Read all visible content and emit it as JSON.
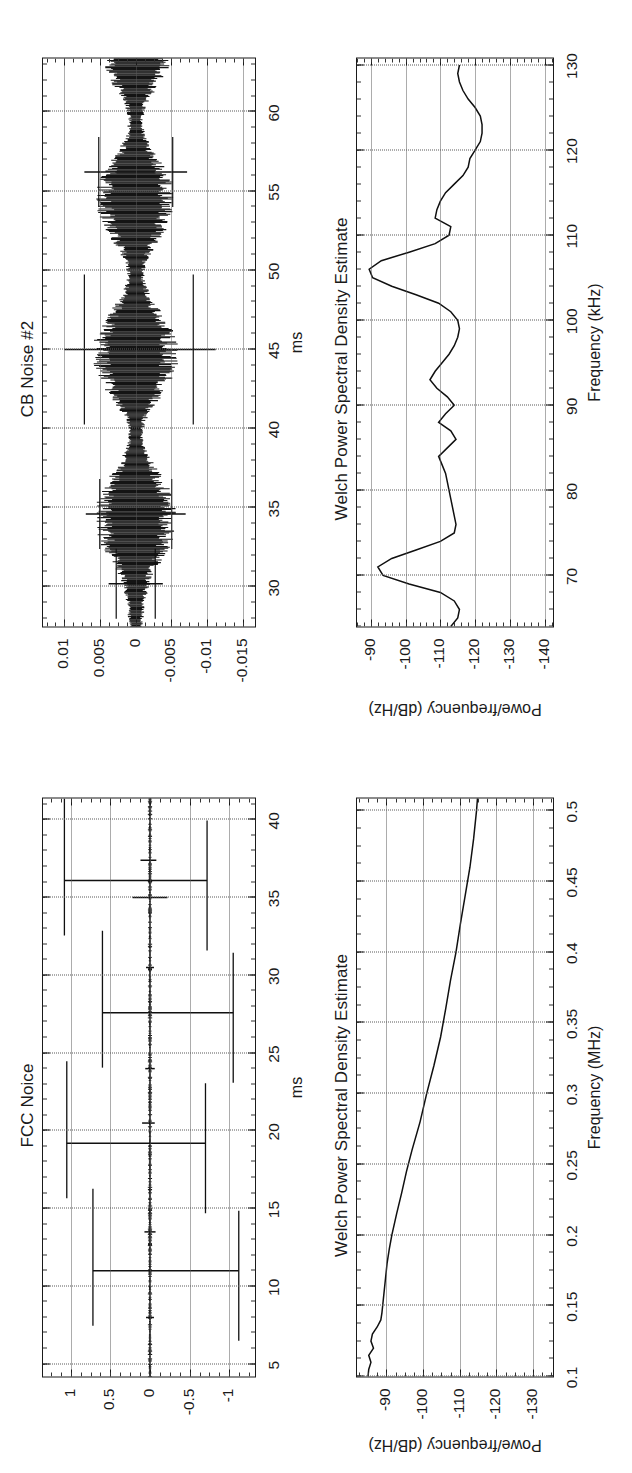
{
  "figure": {
    "layout": "2x2 grid, rotated 90 degrees counter-clockwise on the page",
    "panel_count": 4
  },
  "panels": {
    "cb_time": {
      "title": "CB Noise #2",
      "xlabel": "ms",
      "ylabel": "",
      "xticks": [
        "30",
        "35",
        "40",
        "45",
        "50",
        "55",
        "60"
      ],
      "yticks": [
        "0.01",
        "0.005",
        "0",
        "-0.005",
        "-0.01",
        "-0.015"
      ]
    },
    "cb_psd": {
      "title": "Welch Power Spectral Density Estimate",
      "xlabel": "Frequency (kHz)",
      "ylabel": "Powe/frequency (dB/Hz)",
      "xticks": [
        "70",
        "80",
        "90",
        "100",
        "110",
        "120",
        "130"
      ],
      "yticks": [
        "-90",
        "-100",
        "-110",
        "-120",
        "-130",
        "-140"
      ]
    },
    "fcc_time": {
      "title": "FCC Noice",
      "xlabel": "ms",
      "ylabel": "",
      "xticks": [
        "5",
        "10",
        "15",
        "20",
        "25",
        "30",
        "35",
        "40"
      ],
      "yticks": [
        "1",
        "0.5",
        "0",
        "-0.5",
        "-1"
      ]
    },
    "fcc_psd": {
      "title": "Welch Power Spectral Density Estimate",
      "xlabel": "Frequency (MHz)",
      "ylabel": "Powe/frequency (dB/Hz)",
      "xticks": [
        "0.1",
        "0.15",
        "0.2",
        "0.25",
        "0.3",
        "0.35",
        "0.4",
        "0.45",
        "0.5"
      ],
      "yticks": [
        "-90",
        "-100",
        "-110",
        "-120",
        "-130"
      ]
    }
  },
  "chart_data": [
    {
      "id": "cb_time",
      "type": "line",
      "title": "CB Noise #2",
      "xlabel": "ms",
      "ylabel": "",
      "xlim": [
        27.5,
        63.5
      ],
      "ylim": [
        -0.017,
        0.013
      ],
      "xticks": [
        30,
        35,
        40,
        45,
        50,
        55,
        60
      ],
      "yticks": [
        0.01,
        0.005,
        0,
        -0.005,
        -0.01,
        -0.015
      ],
      "grid": true,
      "legend": "none",
      "description": "Amplitude-modulated impulsive noise burst train; envelope peaks near 34, 44, 54 and 62 ms with narrow nulls near 31, 39, 49 and 58 ms. Two tall isolated spikes at ~45 ms reaching +0.010 / -0.011.",
      "envelope_x": [
        27.5,
        29.0,
        30.5,
        31.5,
        32.5,
        33.5,
        34.5,
        35.5,
        36.5,
        37.5,
        38.5,
        39.5,
        40.5,
        41.5,
        42.5,
        43.5,
        44.5,
        45.5,
        46.5,
        47.5,
        48.5,
        49.5,
        50.5,
        51.5,
        52.5,
        53.5,
        54.5,
        55.5,
        56.5,
        57.5,
        58.5,
        59.5,
        60.5,
        61.5,
        62.5,
        63.5
      ],
      "envelope_pos": [
        0.001,
        0.0013,
        0.0022,
        0.0036,
        0.0048,
        0.0056,
        0.0058,
        0.0055,
        0.0045,
        0.003,
        0.0017,
        0.001,
        0.0014,
        0.0028,
        0.0044,
        0.0056,
        0.0062,
        0.006,
        0.005,
        0.0035,
        0.002,
        0.0012,
        0.0015,
        0.0028,
        0.0043,
        0.0053,
        0.0057,
        0.0054,
        0.0042,
        0.0026,
        0.0014,
        0.001,
        0.0016,
        0.003,
        0.0044,
        0.0052
      ],
      "envelope_neg": [
        -0.001,
        -0.0013,
        -0.0022,
        -0.0036,
        -0.0048,
        -0.0056,
        -0.0058,
        -0.0055,
        -0.0045,
        -0.003,
        -0.0017,
        -0.001,
        -0.0014,
        -0.0028,
        -0.0044,
        -0.0056,
        -0.0062,
        -0.006,
        -0.005,
        -0.0035,
        -0.002,
        -0.0012,
        -0.0015,
        -0.0028,
        -0.0043,
        -0.0053,
        -0.0057,
        -0.0054,
        -0.0042,
        -0.0026,
        -0.0014,
        -0.001,
        -0.0016,
        -0.003,
        -0.0044,
        -0.0052
      ],
      "spikes": [
        {
          "x": 45.0,
          "ymin": -0.0112,
          "ymax": 0.01
        },
        {
          "x": 56.2,
          "ymin": -0.0072,
          "ymax": 0.0072
        },
        {
          "x": 34.6,
          "ymin": -0.007,
          "ymax": 0.007
        },
        {
          "x": 30.2,
          "ymin": -0.0038,
          "ymax": 0.0038
        }
      ]
    },
    {
      "id": "cb_psd",
      "type": "line",
      "title": "Welch Power Spectral Density Estimate",
      "xlabel": "Frequency (kHz)",
      "ylabel": "Powe/frequency (dB/Hz)",
      "xlim": [
        64,
        131
      ],
      "ylim": [
        -143,
        -86
      ],
      "xticks": [
        70,
        80,
        90,
        100,
        110,
        120,
        130
      ],
      "yticks": [
        -90,
        -100,
        -110,
        -120,
        -130,
        -140
      ],
      "grid": true,
      "legend": "none",
      "x": [
        64,
        65,
        66,
        67,
        68,
        69,
        70,
        71,
        72,
        73,
        74,
        75,
        76,
        77,
        78,
        79,
        80,
        81,
        82,
        83,
        84,
        85,
        86,
        87,
        88,
        89,
        90,
        91,
        92,
        93,
        94,
        95,
        96,
        97,
        98,
        99,
        100,
        101,
        102,
        103,
        104,
        105,
        106,
        107,
        108,
        109,
        110,
        111,
        112,
        113,
        114,
        115,
        116,
        117,
        118,
        119,
        120,
        121,
        122,
        123,
        124,
        125,
        126,
        127,
        128,
        129,
        130
      ],
      "y": [
        -113.0,
        -115.0,
        -115.5,
        -114.0,
        -110.0,
        -101.0,
        -93.5,
        -92.0,
        -96.0,
        -103.0,
        -110.0,
        -114.0,
        -114.5,
        -114.0,
        -113.5,
        -113.0,
        -112.5,
        -112.0,
        -111.5,
        -110.5,
        -109.5,
        -112.0,
        -114.5,
        -113.0,
        -109.5,
        -111.5,
        -114.0,
        -112.0,
        -109.0,
        -107.0,
        -108.5,
        -110.5,
        -112.5,
        -114.0,
        -115.0,
        -115.5,
        -115.0,
        -113.0,
        -109.5,
        -103.0,
        -96.0,
        -90.5,
        -89.5,
        -93.0,
        -101.0,
        -108.5,
        -112.5,
        -113.0,
        -108.5,
        -109.0,
        -110.0,
        -111.5,
        -114.0,
        -116.5,
        -118.0,
        -118.5,
        -120.0,
        -121.5,
        -122.0,
        -122.0,
        -121.5,
        -120.0,
        -118.0,
        -116.5,
        -115.5,
        -115.0,
        -115.5
      ]
    },
    {
      "id": "fcc_time",
      "type": "line",
      "title": "FCC Noice",
      "xlabel": "ms",
      "ylabel": "",
      "xlim": [
        4.2,
        41.5
      ],
      "ylim": [
        -1.35,
        1.35
      ],
      "xticks": [
        5,
        10,
        15,
        20,
        25,
        30,
        35,
        40
      ],
      "yticks": [
        1,
        0.5,
        0,
        -0.5,
        -1
      ],
      "grid": true,
      "legend": "none",
      "description": "Impulsive FCC noise: low-level baseline near zero with four dominant full-scale impulses.",
      "baseline": 0,
      "spikes": [
        {
          "x": 11.0,
          "ymin": -1.12,
          "ymax": 0.72
        },
        {
          "x": 19.2,
          "ymin": -0.7,
          "ymax": 1.05
        },
        {
          "x": 27.6,
          "ymin": -1.05,
          "ymax": 0.6
        },
        {
          "x": 36.1,
          "ymin": -0.72,
          "ymax": 1.08
        },
        {
          "x": 20.5,
          "ymin": -0.06,
          "ymax": 0.1
        },
        {
          "x": 37.4,
          "ymin": -0.08,
          "ymax": 0.12
        },
        {
          "x": 35.0,
          "ymin": -0.22,
          "ymax": 0.22
        },
        {
          "x": 8.0,
          "ymin": -0.05,
          "ymax": 0.05
        },
        {
          "x": 13.5,
          "ymin": -0.07,
          "ymax": 0.07
        },
        {
          "x": 24.0,
          "ymin": -0.06,
          "ymax": 0.06
        },
        {
          "x": 30.5,
          "ymin": -0.05,
          "ymax": 0.05
        }
      ]
    },
    {
      "id": "fcc_psd",
      "type": "line",
      "title": "Welch Power Spectral Density Estimate",
      "xlabel": "Frequency (MHz)",
      "ylabel": "Powe/frequency (dB/Hz)",
      "xlim": [
        0.1,
        0.51
      ],
      "ylim": [
        -136,
        -82
      ],
      "xticks": [
        0.1,
        0.15,
        0.2,
        0.25,
        0.3,
        0.35,
        0.4,
        0.45,
        0.5
      ],
      "yticks": [
        -90,
        -100,
        -110,
        -120,
        -130
      ],
      "grid": true,
      "legend": "none",
      "x": [
        0.1,
        0.105,
        0.11,
        0.115,
        0.12,
        0.125,
        0.13,
        0.135,
        0.14,
        0.145,
        0.15,
        0.16,
        0.17,
        0.18,
        0.19,
        0.2,
        0.215,
        0.23,
        0.245,
        0.26,
        0.28,
        0.3,
        0.32,
        0.34,
        0.36,
        0.38,
        0.4,
        0.42,
        0.44,
        0.46,
        0.48,
        0.5,
        0.51
      ],
      "y": [
        -85.0,
        -85.2,
        -85.8,
        -85.2,
        -86.5,
        -85.8,
        -86.2,
        -87.5,
        -88.5,
        -88.8,
        -89.0,
        -89.4,
        -89.8,
        -90.2,
        -90.8,
        -91.5,
        -92.8,
        -94.2,
        -95.5,
        -97.0,
        -99.2,
        -101.0,
        -103.0,
        -104.8,
        -106.2,
        -107.5,
        -109.0,
        -110.2,
        -111.5,
        -112.8,
        -113.8,
        -114.6,
        -114.9
      ]
    }
  ]
}
